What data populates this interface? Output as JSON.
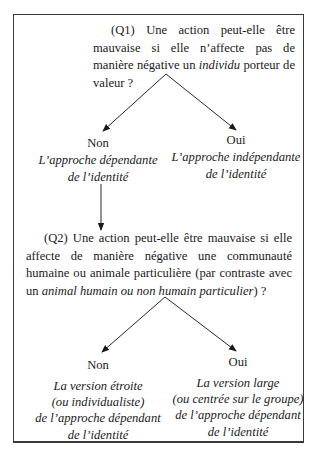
{
  "q1": {
    "prefix": "(Q1) Une action peut-elle être mauvaise si elle n’affecte pas de manière négative un",
    "emphasis": "individu",
    "suffix": " porteur de valeur ?"
  },
  "q1_answers": {
    "non": {
      "label": "Non",
      "description_line1": "L’approche dépendante",
      "description_line2": "de l’identité"
    },
    "oui": {
      "label": "Oui",
      "description_line1": "L’approche indépendante",
      "description_line2": "de l’identité"
    }
  },
  "q2": {
    "prefix": "(Q2) Une action peut-elle être mauvaise si elle affecte de manière négative une communauté humaine ou animale particulière (par contraste avec un ",
    "emphasis": "animal humain ou non humain particulier",
    "suffix": ") ?"
  },
  "q2_answers": {
    "non": {
      "label": "Non",
      "description_line1": "La version étroite",
      "description_line2": "(ou individualiste)",
      "description_line3": "de l’approche dépendant",
      "description_line4": "de l’identité"
    },
    "oui": {
      "label": "Oui",
      "description_line1": "La version large",
      "description_line2": "(ou centrée sur le groupe)",
      "description_line3": "de l’approche dépendant",
      "description_line4": "de l’identité"
    }
  },
  "flow": {
    "edges": [
      {
        "from": "q1",
        "to": "q1-non",
        "label": "Non"
      },
      {
        "from": "q1",
        "to": "q1-oui",
        "label": "Oui"
      },
      {
        "from": "q1-non",
        "to": "q2",
        "label": ""
      },
      {
        "from": "q2",
        "to": "q2-non",
        "label": "Non"
      },
      {
        "from": "q2",
        "to": "q2-oui",
        "label": "Oui"
      }
    ]
  }
}
